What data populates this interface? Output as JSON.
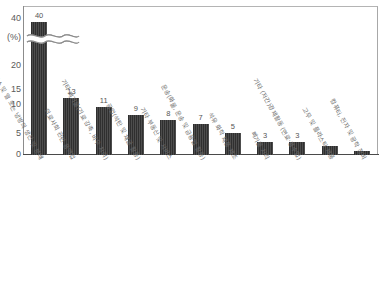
{
  "chart_data": {
    "type": "bar",
    "title": "",
    "xlabel": "",
    "ylabel": "(%)",
    "ylim": [
      0,
      42
    ],
    "grid": false,
    "legend": null,
    "axis_break": {
      "present": true,
      "symbol": "wavy-double-line",
      "between_ticks": [
        20,
        40
      ],
      "note": "첫 번째 막대에 축 생략 표시"
    },
    "ytick_labels": [
      "40",
      "(%)",
      "20",
      "15",
      "10",
      "5",
      "0"
    ],
    "ytick_values": [
      40,
      null,
      20,
      15,
      10,
      5,
      0
    ],
    "categories": [
      "전기, 가스 및 열 또는 냉방의 생산 및 분배",
      "의료사회 관련 용역업",
      "기타 폐기물(기료 감축, 비우 처리)",
      "광업(석탄 및 채굴 활동)",
      "기타 부동산 및 서비스",
      "운송(화물, 운송 및 금융업 활동)",
      "석유 화학 제품 제조",
      "폐기물 처리",
      "기타 (저간)경제활동 (연료·용수업)",
      "고무 및 플라스틱 제품",
      "컴퓨터, 전자 및 광학 장비"
    ],
    "values": [
      40,
      13,
      11,
      9,
      8,
      7,
      5,
      3,
      3,
      2,
      1
    ],
    "value_labels": [
      "40",
      "13",
      "11",
      "9",
      "8",
      "7",
      "5",
      "3",
      "3",
      "",
      ""
    ],
    "bar_color": "#3a3a3a",
    "bar_fill_pattern": "vertical-stripes",
    "background_color": "#ffffff",
    "frame_color": "#a8a8a8",
    "text_color": "#5a5a5a"
  },
  "axis": {
    "unit_label": "(%)",
    "zero_label": "0"
  }
}
